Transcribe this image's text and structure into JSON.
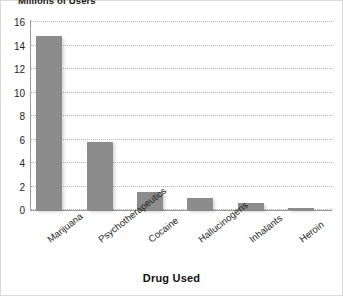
{
  "chart_data": {
    "type": "bar",
    "title": "Millions of Users",
    "xlabel": "Drug Used",
    "ylabel": "Millions of Users",
    "categories": [
      "Marijuana",
      "Psychotherapeutics",
      "Cocaine",
      "Hallucinogens",
      "Inhalants",
      "Heroin"
    ],
    "values": [
      14.8,
      5.8,
      1.5,
      1.0,
      0.6,
      0.2
    ],
    "ylim": [
      0,
      16
    ],
    "yticks": [
      0,
      2,
      4,
      6,
      8,
      10,
      12,
      14,
      16
    ],
    "ytick_labels": [
      "0",
      "2",
      "4",
      "6",
      "8",
      "10",
      "12",
      "14",
      "16"
    ],
    "grid": "horizontal-dotted",
    "legend": "none",
    "bar_color": "#8c8c8c",
    "background_color": "#ffffff",
    "gridline_color": "#b0b0b0",
    "axis_color": "#9a9a9a"
  }
}
